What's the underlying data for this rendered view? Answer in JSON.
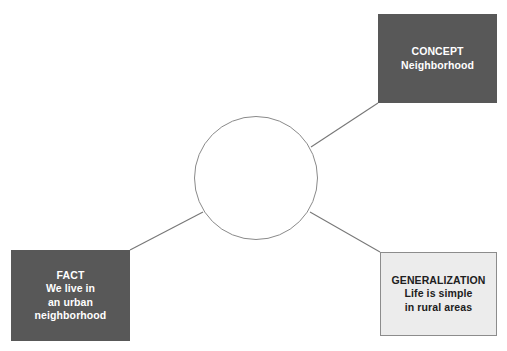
{
  "canvas": {
    "width": 507,
    "height": 351,
    "background": "#ffffff"
  },
  "colors": {
    "dark_box_fill": "#585858",
    "dark_box_text": "#ffffff",
    "light_box_fill": "#ececec",
    "light_box_border": "#8c8c8c",
    "light_box_text": "#202020",
    "connector_line": "#777777",
    "circle_border": "#8a8a8a",
    "circle_fill": "#ffffff"
  },
  "center": {
    "label": "",
    "shape": "circle",
    "cx": 256,
    "cy": 178,
    "r": 62
  },
  "nodes": {
    "concept": {
      "title": "CONCEPT",
      "lines": [
        "CONCEPT",
        "Neighborhood"
      ],
      "style": "dark"
    },
    "fact": {
      "title": "FACT",
      "lines": [
        "FACT",
        "We live in",
        "an urban",
        "neighborhood"
      ],
      "style": "dark"
    },
    "generalization": {
      "title": "GENERALIZATION",
      "lines": [
        "GENERALIZATION",
        "Life is simple",
        "in rural areas"
      ],
      "style": "light"
    }
  },
  "connectors": [
    {
      "name": "circle-to-concept",
      "from": "center-circle",
      "to": "concept",
      "x1": 311,
      "y1": 147,
      "x2": 378,
      "y2": 103
    },
    {
      "name": "circle-to-fact",
      "from": "center-circle",
      "to": "fact",
      "x1": 203,
      "y1": 212,
      "x2": 130,
      "y2": 250
    },
    {
      "name": "circle-to-generalization",
      "from": "center-circle",
      "to": "generalization",
      "x1": 310,
      "y1": 212,
      "x2": 380,
      "y2": 252
    }
  ]
}
